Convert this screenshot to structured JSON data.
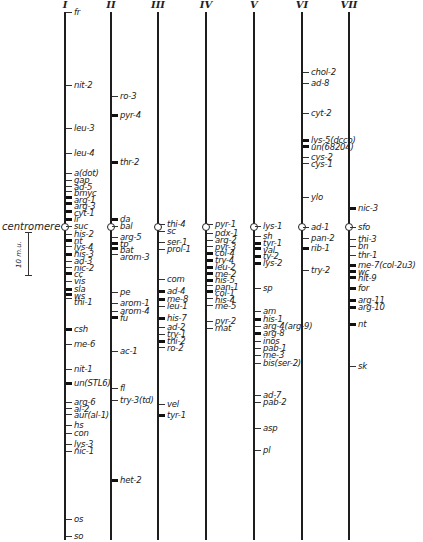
{
  "figure": {
    "centromere_label": "centromere",
    "scale_label": "10 m.u.",
    "scale_bar": {
      "x": 28,
      "y_top": 232,
      "y_bottom": 275
    },
    "line_color": "#1e1e1e"
  },
  "chromosomes": [
    {
      "id": "I",
      "x": 64,
      "top": 12,
      "bottom": 540,
      "centromere": 227,
      "label_side": "right",
      "genes": [
        {
          "name": "fr",
          "y": 12
        },
        {
          "name": "nit-2",
          "y": 85
        },
        {
          "name": "leu-3",
          "y": 128
        },
        {
          "name": "leu-4",
          "y": 153
        },
        {
          "name": "a(dot)",
          "y": 173
        },
        {
          "name": "gap",
          "y": 180
        },
        {
          "name": "ad-5",
          "y": 186
        },
        {
          "name": "bmyc",
          "y": 191
        },
        {
          "name": "arg-1",
          "y": 197
        },
        {
          "name": "arg-3",
          "y": 203
        },
        {
          "name": "cyt-1",
          "y": 211
        },
        {
          "name": "li",
          "y": 219
        },
        {
          "name": "suc",
          "y": 226
        },
        {
          "name": "his-2",
          "y": 234
        },
        {
          "name": "nt",
          "y": 240
        },
        {
          "name": "lys-4",
          "y": 246
        },
        {
          "name": "his-3",
          "y": 254
        },
        {
          "name": "ad-3",
          "y": 261
        },
        {
          "name": "nic-2",
          "y": 267
        },
        {
          "name": "cc",
          "y": 273
        },
        {
          "name": "vis",
          "y": 281
        },
        {
          "name": "sla",
          "y": 289
        },
        {
          "name": "ws",
          "y": 294
        },
        {
          "name": "thi-1",
          "y": 298
        },
        {
          "name": "csh",
          "y": 329
        },
        {
          "name": "me-6",
          "y": 344
        },
        {
          "name": "nit-1",
          "y": 369
        },
        {
          "name": "un(STL6)",
          "y": 383
        },
        {
          "name": "arg-6",
          "y": 402
        },
        {
          "name": "al-2",
          "y": 408
        },
        {
          "name": "aur(al-1)",
          "y": 414
        },
        {
          "name": "hs",
          "y": 425
        },
        {
          "name": "con",
          "y": 433
        },
        {
          "name": "lys-3",
          "y": 444
        },
        {
          "name": "nic-1",
          "y": 451
        },
        {
          "name": "os",
          "y": 519
        },
        {
          "name": "so",
          "y": 536
        }
      ]
    },
    {
      "id": "II",
      "x": 110,
      "top": 12,
      "bottom": 540,
      "centromere": 227,
      "label_side": "right",
      "genes": [
        {
          "name": "ro-3",
          "y": 96
        },
        {
          "name": "pyr-4",
          "y": 115
        },
        {
          "name": "thr-2",
          "y": 162
        },
        {
          "name": "da",
          "y": 219
        },
        {
          "name": "bal",
          "y": 226
        },
        {
          "name": "arg-5",
          "y": 237
        },
        {
          "name": "tp",
          "y": 243
        },
        {
          "name": "bat",
          "y": 248
        },
        {
          "name": "arom-3",
          "y": 254
        },
        {
          "name": "pe",
          "y": 292
        },
        {
          "name": "arom-1",
          "y": 303
        },
        {
          "name": "arom-4",
          "y": 311
        },
        {
          "name": "fu",
          "y": 317
        },
        {
          "name": "ac-1",
          "y": 351
        },
        {
          "name": "fl",
          "y": 388
        },
        {
          "name": "try-3(td)",
          "y": 400
        },
        {
          "name": "het-2",
          "y": 480
        }
      ]
    },
    {
      "id": "III",
      "x": 157,
      "top": 12,
      "bottom": 540,
      "centromere": 227,
      "label_side": "right",
      "genes": [
        {
          "name": "thi-4",
          "y": 224
        },
        {
          "name": "sc",
          "y": 231
        },
        {
          "name": "ser-1",
          "y": 242
        },
        {
          "name": "prol-1",
          "y": 249
        },
        {
          "name": "com",
          "y": 279
        },
        {
          "name": "ad-4",
          "y": 291
        },
        {
          "name": "me-8",
          "y": 299
        },
        {
          "name": "leu-1",
          "y": 306
        },
        {
          "name": "his-7",
          "y": 318
        },
        {
          "name": "ad-2",
          "y": 327
        },
        {
          "name": "try-1",
          "y": 334
        },
        {
          "name": "thi-2",
          "y": 341
        },
        {
          "name": "ro-2",
          "y": 347
        },
        {
          "name": "vel",
          "y": 404
        },
        {
          "name": "tyr-1",
          "y": 415
        }
      ]
    },
    {
      "id": "IV",
      "x": 205,
      "top": 12,
      "bottom": 540,
      "centromere": 227,
      "label_side": "right",
      "genes": [
        {
          "name": "pyr-1",
          "y": 224
        },
        {
          "name": "pdx-1",
          "y": 233
        },
        {
          "name": "arg-2",
          "y": 240
        },
        {
          "name": "pyr-3",
          "y": 246
        },
        {
          "name": "col-4",
          "y": 253
        },
        {
          "name": "try-4",
          "y": 260
        },
        {
          "name": "leu-2",
          "y": 267
        },
        {
          "name": "me-2",
          "y": 273
        },
        {
          "name": "his-5",
          "y": 280
        },
        {
          "name": "pan-1",
          "y": 285
        },
        {
          "name": "col-1",
          "y": 291
        },
        {
          "name": "his-4",
          "y": 298
        },
        {
          "name": "me-5",
          "y": 305
        },
        {
          "name": "pyr-2",
          "y": 321
        },
        {
          "name": "mat",
          "y": 328
        }
      ]
    },
    {
      "id": "V",
      "x": 253,
      "top": 12,
      "bottom": 540,
      "centromere": 227,
      "label_side": "right",
      "genes": [
        {
          "name": "lys-1",
          "y": 226
        },
        {
          "name": "sh",
          "y": 236
        },
        {
          "name": "tyr-1",
          "y": 243
        },
        {
          "name": "val",
          "y": 248
        },
        {
          "name": "ty-2",
          "y": 256
        },
        {
          "name": "lys-2",
          "y": 263
        },
        {
          "name": "sp",
          "y": 288
        },
        {
          "name": "am",
          "y": 311
        },
        {
          "name": "his-1",
          "y": 319
        },
        {
          "name": "arg-4(arg-9)",
          "y": 326
        },
        {
          "name": "arg-8",
          "y": 333
        },
        {
          "name": "inos",
          "y": 341
        },
        {
          "name": "pab-1",
          "y": 348
        },
        {
          "name": "me-3",
          "y": 355
        },
        {
          "name": "bis(ser-2)",
          "y": 363
        },
        {
          "name": "ad-7",
          "y": 395
        },
        {
          "name": "pab-2",
          "y": 402
        },
        {
          "name": "asp",
          "y": 428
        },
        {
          "name": "pl",
          "y": 450
        }
      ]
    },
    {
      "id": "VI",
      "x": 301,
      "top": 12,
      "bottom": 540,
      "centromere": 227,
      "label_side": "right",
      "genes": [
        {
          "name": "chol-2",
          "y": 72
        },
        {
          "name": "ad-8",
          "y": 83
        },
        {
          "name": "cyt-2",
          "y": 113
        },
        {
          "name": "lys-5(dcco)",
          "y": 140
        },
        {
          "name": "un(68204)",
          "y": 146
        },
        {
          "name": "cys-2",
          "y": 157
        },
        {
          "name": "cys-1",
          "y": 163
        },
        {
          "name": "ylo",
          "y": 197
        },
        {
          "name": "ad-1",
          "y": 227
        },
        {
          "name": "pan-2",
          "y": 238
        },
        {
          "name": "rib-1",
          "y": 248
        },
        {
          "name": "try-2",
          "y": 270
        }
      ]
    },
    {
      "id": "VII",
      "x": 348,
      "top": 12,
      "bottom": 540,
      "centromere": 227,
      "label_side": "right",
      "genes": [
        {
          "name": "nic-3",
          "y": 208
        },
        {
          "name": "sfo",
          "y": 227
        },
        {
          "name": "thi-3",
          "y": 239
        },
        {
          "name": "bn",
          "y": 246
        },
        {
          "name": "thr-1",
          "y": 255
        },
        {
          "name": "me-7(col-2u3)",
          "y": 265
        },
        {
          "name": "wc",
          "y": 271
        },
        {
          "name": "hlt-9",
          "y": 277
        },
        {
          "name": "for",
          "y": 288
        },
        {
          "name": "arg-11",
          "y": 300
        },
        {
          "name": "arg-10",
          "y": 307
        },
        {
          "name": "nt",
          "y": 324
        },
        {
          "name": "sk",
          "y": 366
        }
      ]
    }
  ],
  "chart_data": {
    "type": "table",
    "legend": {
      "centromere": "open circle",
      "scale": "10 m.u."
    },
    "columns": [
      "I",
      "II",
      "III",
      "IV",
      "V",
      "VI",
      "VII"
    ]
  }
}
